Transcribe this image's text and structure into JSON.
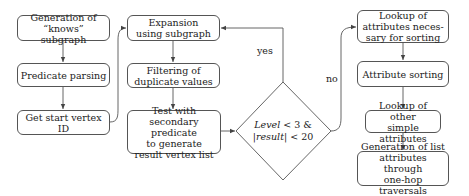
{
  "diagram": {
    "nodes": {
      "gen_knows": {
        "line1": "Generation of",
        "line2": "“knows” subgraph"
      },
      "predicate_parsing": {
        "line1": "Predicate parsing"
      },
      "get_start": {
        "line1": "Get start vertex ID"
      },
      "expansion": {
        "line1": "Expansion",
        "line2": "using subgraph"
      },
      "filtering": {
        "line1": "Filtering of",
        "line2": "duplicate values"
      },
      "test": {
        "line1": "Test with",
        "line2": "secondary predicate",
        "line3": "to generate",
        "line4": "result vertex list"
      },
      "decision": {
        "line1_var": "Level",
        "line1_rest": " < 3 &",
        "line2_pre": "|",
        "line2_var": "result",
        "line2_rest": "| < 20"
      },
      "lookup_sort": {
        "line1": "Lookup of",
        "line2": "attributes neces-",
        "line3": "sary for sorting"
      },
      "attr_sorting": {
        "line1": "Attribute sorting"
      },
      "lookup_other": {
        "line1": "Lookup of other",
        "line2": "simple attributes"
      },
      "gen_list": {
        "line1": "Generation of list",
        "line2": "attributes through",
        "line3": "one-hop traversals"
      }
    },
    "edge_labels": {
      "yes": "yes",
      "no": "no"
    },
    "colors": {
      "stroke": "#555555",
      "text": "#222222",
      "background": "#ffffff"
    }
  }
}
